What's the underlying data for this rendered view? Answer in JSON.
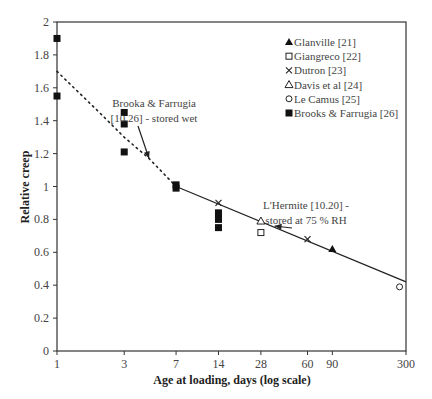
{
  "chart_data": {
    "type": "scatter",
    "title": "",
    "xlabel": "Age at loading, days (log scale)",
    "ylabel": "Relative creep",
    "xscale": "log",
    "xlim": [
      1,
      300
    ],
    "ylim": [
      0,
      2
    ],
    "x_ticks": [
      1,
      3,
      7,
      14,
      28,
      60,
      90,
      300
    ],
    "y_ticks": [
      "0",
      "0.2",
      "0.4",
      "0.6",
      "0.8",
      "1",
      "1.2",
      "1.4",
      "1.6",
      "1.8",
      "2"
    ],
    "grid": false,
    "legend_position": "upper right (inside)",
    "series": [
      {
        "name": "Glanville [21]",
        "marker": "filled-triangle",
        "points": [
          [
            90,
            0.62
          ]
        ]
      },
      {
        "name": "Giangreco [22]",
        "marker": "open-square",
        "points": [
          [
            28,
            0.72
          ]
        ]
      },
      {
        "name": "Dutron [23]",
        "marker": "x",
        "points": [
          [
            14,
            0.9
          ],
          [
            60,
            0.68
          ]
        ]
      },
      {
        "name": "Davis et al [24]",
        "marker": "open-triangle",
        "points": [
          [
            28,
            0.79
          ]
        ]
      },
      {
        "name": "Le Camus [25]",
        "marker": "open-circle",
        "points": [
          [
            270,
            0.39
          ]
        ]
      },
      {
        "name": "Brooks & Farrugia [26]",
        "marker": "filled-square",
        "points": [
          [
            1,
            1.9
          ],
          [
            1,
            1.55
          ],
          [
            3,
            1.45
          ],
          [
            3,
            1.38
          ],
          [
            3,
            1.21
          ],
          [
            7,
            1.01
          ],
          [
            7,
            0.99
          ],
          [
            14,
            0.84
          ],
          [
            14,
            0.8
          ],
          [
            14,
            0.75
          ]
        ]
      }
    ],
    "curves": [
      {
        "name": "Brooka & Farrugia [10.26] - stored wet",
        "style": "dotted",
        "points": [
          [
            1,
            1.7
          ],
          [
            2,
            1.45
          ],
          [
            3,
            1.3
          ],
          [
            4.5,
            1.17
          ],
          [
            7,
            1.0
          ]
        ]
      },
      {
        "name": "L'Hermite [10.20] - stored at 75 % RH",
        "style": "solid",
        "points": [
          [
            7,
            1.0
          ],
          [
            300,
            0.42
          ]
        ]
      }
    ],
    "annotations": [
      {
        "text": [
          "Brooka & Farrugia",
          "[10.26] - stored wet"
        ],
        "arrow_to": [
          4.5,
          1.17
        ]
      },
      {
        "text": [
          "L'Hermite [10.20] -",
          "stored at 75 % RH"
        ],
        "arrow_to": [
          35,
          0.76
        ]
      }
    ]
  }
}
